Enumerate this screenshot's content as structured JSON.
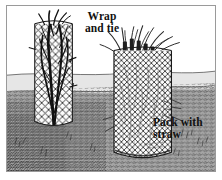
{
  "illustration": {
    "title": "Wire mesh plant protection cages",
    "medium": "pen-and-ink line drawing",
    "palette": {
      "paper": "#ffffff",
      "ink": "#1a1a1a",
      "frame_border": "#9a9a9a",
      "far_field": "#e3e3e3",
      "mid_field": "#d2d2d2",
      "near_ground": "#8e8e8e",
      "mesh_line": "#2a2a2a",
      "shrub": "#111111",
      "straw": "#5a5a5a"
    }
  },
  "labels": {
    "wrap_and_tie": "Wrap\nand tie",
    "pack_with_straw": "Pack with\nstraw"
  },
  "scene": {
    "horizon_label": "horizon line",
    "objects": [
      {
        "name": "left-cage",
        "description": "wire mesh cylinder wrapped and tied around a bare dark shrub",
        "contents": "shrub branches"
      },
      {
        "name": "right-cage",
        "description": "wire mesh cylinder packed with straw, straw tufts protruding from the top",
        "contents": "straw"
      }
    ],
    "ground": "textured soil with grass hatching in foreground"
  },
  "signature": {
    "present": true,
    "text": "",
    "note": "illegible handwritten artist signature"
  }
}
